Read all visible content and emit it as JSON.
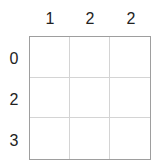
{
  "puzzle": {
    "column_clues": [
      "1",
      "2",
      "2"
    ],
    "row_clues": [
      "0",
      "2",
      "3"
    ],
    "rows": 3,
    "cols": 3,
    "cells": [
      [
        "",
        "",
        ""
      ],
      [
        "",
        "",
        ""
      ],
      [
        "",
        "",
        ""
      ]
    ]
  }
}
